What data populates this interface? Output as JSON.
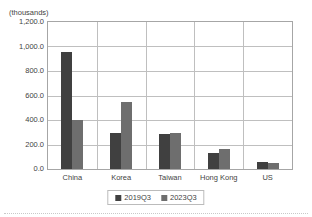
{
  "chart_data": {
    "type": "bar",
    "title": "",
    "subtitle": "",
    "units_note": "(thousands)",
    "xlabel": "",
    "ylabel": "",
    "categories": [
      "China",
      "Korea",
      "Taiwan",
      "Hong Kong",
      "US"
    ],
    "series": [
      {
        "name": "2019Q3",
        "color": "#404040",
        "values": [
          955,
          290,
          288,
          130,
          55
        ]
      },
      {
        "name": "2023Q3",
        "color": "#6e6e6e",
        "values": [
          400,
          545,
          295,
          160,
          50
        ]
      }
    ],
    "ylim": [
      0,
      1200
    ],
    "ytick_values": [
      0,
      200,
      400,
      600,
      800,
      1000,
      1200
    ],
    "ytick_labels": [
      "0.0",
      "200.0",
      "400.0",
      "600.0",
      "800.0",
      "1,000.0",
      "1,200.0"
    ],
    "grid": {
      "horizontal": true,
      "vertical": true
    },
    "legend": {
      "position": "bottom-center",
      "bordered": true,
      "entries": [
        {
          "label": "2019Q3",
          "color": "#404040",
          "swatch": "square-swatch"
        },
        {
          "label": "2023Q3",
          "color": "#6e6e6e",
          "swatch": "square-swatch"
        }
      ]
    }
  }
}
